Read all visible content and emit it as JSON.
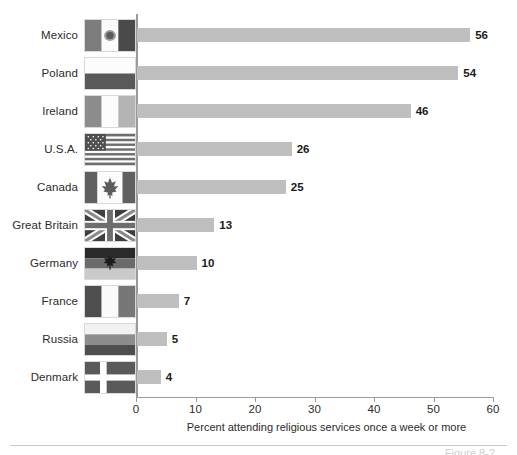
{
  "chart_data": {
    "type": "bar",
    "orientation": "horizontal",
    "title": "",
    "xlabel": "Percent attending religious services once a week or more",
    "ylabel": "",
    "xlim": [
      0,
      60
    ],
    "xticks": [
      0,
      10,
      20,
      30,
      40,
      50,
      60
    ],
    "grid": false,
    "legend": null,
    "bar_color": "#bfbfbf",
    "categories": [
      "Mexico",
      "Poland",
      "Ireland",
      "U.S.A.",
      "Canada",
      "Great Britain",
      "Germany",
      "France",
      "Russia",
      "Denmark"
    ],
    "values": [
      56,
      54,
      46,
      26,
      25,
      13,
      10,
      7,
      5,
      4
    ],
    "rows": [
      {
        "label": "Mexico",
        "value": 56,
        "value_text": "56",
        "flag": "mexico-flag"
      },
      {
        "label": "Poland",
        "value": 54,
        "value_text": "54",
        "flag": "poland-flag"
      },
      {
        "label": "Ireland",
        "value": 46,
        "value_text": "46",
        "flag": "ireland-flag"
      },
      {
        "label": "U.S.A.",
        "value": 26,
        "value_text": "26",
        "flag": "usa-flag"
      },
      {
        "label": "Canada",
        "value": 25,
        "value_text": "25",
        "flag": "canada-flag"
      },
      {
        "label": "Great Britain",
        "value": 13,
        "value_text": "13",
        "flag": "great-britain-flag"
      },
      {
        "label": "Germany",
        "value": 10,
        "value_text": "10",
        "flag": "germany-flag"
      },
      {
        "label": "France",
        "value": 7,
        "value_text": "7",
        "flag": "france-flag"
      },
      {
        "label": "Russia",
        "value": 5,
        "value_text": "5",
        "flag": "russia-flag"
      },
      {
        "label": "Denmark",
        "value": 4,
        "value_text": "4",
        "flag": "denmark-flag"
      }
    ]
  },
  "axis": {
    "tick_labels": [
      "0",
      "10",
      "20",
      "30",
      "40",
      "50",
      "60"
    ],
    "title": "Percent attending religious services once a week or more"
  },
  "caption": {
    "text": "Figure 8-2"
  }
}
